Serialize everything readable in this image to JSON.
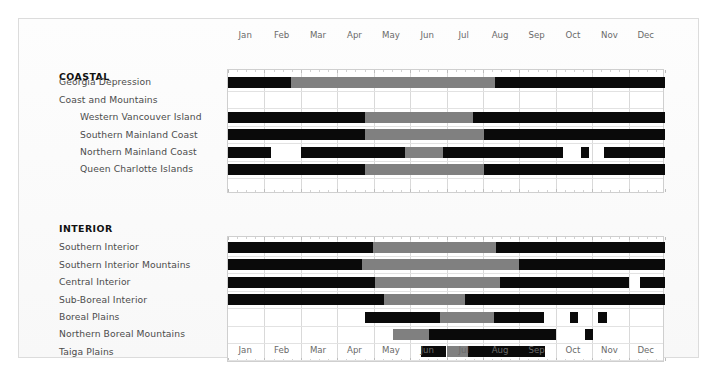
{
  "chart_data": {
    "type": "bar",
    "title": "",
    "xlabel": "",
    "ylabel": "",
    "orientation": "horizontal",
    "axis": {
      "min_month": 1,
      "max_month": 13,
      "grid": true,
      "tick_labels_top": [
        "Jan",
        "Feb",
        "Mar",
        "Apr",
        "May",
        "Jun",
        "Jul",
        "Aug",
        "Sep",
        "Oct",
        "Nov",
        "Dec"
      ],
      "tick_labels_bottom": [
        "Jan",
        "Feb",
        "Mar",
        "Apr",
        "May",
        "Jun",
        "Jul",
        "Aug",
        "Sep",
        "Oct",
        "Nov",
        "Dec"
      ]
    },
    "legend": {
      "position": "none",
      "entries": []
    },
    "colors": {
      "black": "#0a0a0a",
      "grey": "#808080",
      "empty": "#ffffff",
      "grid": "#d9d9d9"
    },
    "sections": [
      {
        "name": "COASTAL",
        "rows": [
          {
            "label": "Georgia Depression",
            "indent": 0,
            "segments": [
              {
                "start": 1.0,
                "end": 2.74,
                "color": "black"
              },
              {
                "start": 2.74,
                "end": 8.32,
                "color": "grey"
              },
              {
                "start": 8.32,
                "end": 13.0,
                "color": "black"
              }
            ]
          },
          {
            "label": "Coast and Mountains",
            "indent": 0,
            "segments": []
          },
          {
            "label": "Western Vancouver Island",
            "indent": 1,
            "segments": [
              {
                "start": 1.0,
                "end": 4.75,
                "color": "black"
              },
              {
                "start": 4.75,
                "end": 7.72,
                "color": "grey"
              },
              {
                "start": 7.72,
                "end": 13.0,
                "color": "black"
              }
            ]
          },
          {
            "label": "Southern Mainland Coast",
            "indent": 1,
            "segments": [
              {
                "start": 1.0,
                "end": 4.75,
                "color": "black"
              },
              {
                "start": 4.75,
                "end": 8.02,
                "color": "grey"
              },
              {
                "start": 8.02,
                "end": 13.0,
                "color": "black"
              }
            ]
          },
          {
            "label": "Northern Mainland Coast",
            "indent": 1,
            "segments": [
              {
                "start": 1.0,
                "end": 2.17,
                "color": "black"
              },
              {
                "start": 3.0,
                "end": 5.86,
                "color": "black"
              },
              {
                "start": 5.86,
                "end": 6.9,
                "color": "grey"
              },
              {
                "start": 6.9,
                "end": 10.2,
                "color": "black"
              },
              {
                "start": 10.7,
                "end": 10.92,
                "color": "black"
              },
              {
                "start": 11.33,
                "end": 13.0,
                "color": "black"
              }
            ]
          },
          {
            "label": "Queen Charlotte Islands",
            "indent": 1,
            "segments": [
              {
                "start": 1.0,
                "end": 4.75,
                "color": "black"
              },
              {
                "start": 4.75,
                "end": 8.02,
                "color": "grey"
              },
              {
                "start": 8.02,
                "end": 13.0,
                "color": "black"
              }
            ]
          }
        ]
      },
      {
        "name": "INTERIOR",
        "rows": [
          {
            "label": "Southern Interior",
            "indent": 0,
            "segments": [
              {
                "start": 1.0,
                "end": 4.99,
                "color": "black"
              },
              {
                "start": 4.99,
                "end": 8.37,
                "color": "grey"
              },
              {
                "start": 8.37,
                "end": 13.0,
                "color": "black"
              }
            ]
          },
          {
            "label": "Southern Interior Mountains",
            "indent": 0,
            "segments": [
              {
                "start": 1.0,
                "end": 4.69,
                "color": "black"
              },
              {
                "start": 4.69,
                "end": 9.0,
                "color": "grey"
              },
              {
                "start": 9.0,
                "end": 13.0,
                "color": "black"
              }
            ]
          },
          {
            "label": "Central Interior",
            "indent": 0,
            "segments": [
              {
                "start": 1.0,
                "end": 5.05,
                "color": "black"
              },
              {
                "start": 5.05,
                "end": 8.48,
                "color": "grey"
              },
              {
                "start": 8.48,
                "end": 12.01,
                "color": "black"
              },
              {
                "start": 12.31,
                "end": 13.0,
                "color": "black"
              }
            ]
          },
          {
            "label": "Sub-Boreal Interior",
            "indent": 0,
            "segments": [
              {
                "start": 1.0,
                "end": 5.29,
                "color": "black"
              },
              {
                "start": 5.29,
                "end": 7.52,
                "color": "grey"
              },
              {
                "start": 7.52,
                "end": 13.0,
                "color": "black"
              }
            ]
          },
          {
            "label": "Boreal Plains",
            "indent": 0,
            "segments": [
              {
                "start": 4.75,
                "end": 6.83,
                "color": "black"
              },
              {
                "start": 6.83,
                "end": 8.31,
                "color": "grey"
              },
              {
                "start": 8.31,
                "end": 9.68,
                "color": "black"
              },
              {
                "start": 10.4,
                "end": 10.62,
                "color": "black"
              },
              {
                "start": 11.16,
                "end": 11.4,
                "color": "black"
              }
            ]
          },
          {
            "label": "Northern Boreal Mountains",
            "indent": 0,
            "segments": [
              {
                "start": 5.53,
                "end": 6.53,
                "color": "grey"
              },
              {
                "start": 6.53,
                "end": 10.0,
                "color": "black"
              },
              {
                "start": 10.8,
                "end": 11.02,
                "color": "black"
              }
            ]
          },
          {
            "label": "Taiga Plains",
            "indent": 0,
            "segments": [
              {
                "start": 6.3,
                "end": 7.0,
                "color": "black"
              },
              {
                "start": 7.0,
                "end": 7.6,
                "color": "grey"
              },
              {
                "start": 7.6,
                "end": 9.7,
                "color": "black"
              }
            ]
          }
        ]
      }
    ]
  },
  "caption": ""
}
